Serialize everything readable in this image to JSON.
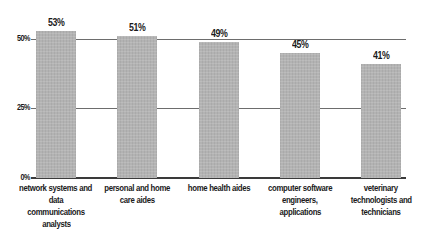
{
  "chart_data": {
    "type": "bar",
    "title": "",
    "xlabel": "",
    "ylabel": "",
    "categories": [
      "network systems and data communications analysts",
      "personal and home care aides",
      "home health aides",
      "computer software engineers, applications",
      "veterinary technologists and technicians"
    ],
    "values": [
      53,
      51,
      49,
      45,
      41
    ],
    "value_labels": [
      "53%",
      "51%",
      "49%",
      "45%",
      "41%"
    ],
    "ylim": [
      0,
      55
    ],
    "yticks": [
      0,
      25,
      50
    ],
    "ytick_labels": [
      "0%",
      "25%",
      "50%"
    ],
    "grid": true,
    "legend": null,
    "bar_color": "#b3b3b3"
  },
  "axis": {
    "ticks": [
      {
        "label": "50%",
        "value": 50
      },
      {
        "label": "25%",
        "value": 25
      },
      {
        "label": "0%",
        "value": 0
      }
    ]
  },
  "bars": [
    {
      "value": 53,
      "label": "53%",
      "category_lines": [
        "network systems and",
        "data communications",
        "analysts"
      ]
    },
    {
      "value": 51,
      "label": "51%",
      "category_lines": [
        "personal and home",
        "care aides"
      ]
    },
    {
      "value": 49,
      "label": "49%",
      "category_lines": [
        "home health aides"
      ]
    },
    {
      "value": 45,
      "label": "45%",
      "category_lines": [
        "computer software",
        "engineers,",
        "applications"
      ]
    },
    {
      "value": 41,
      "label": "41%",
      "category_lines": [
        "veterinary",
        "technologists and",
        "technicians"
      ]
    }
  ]
}
